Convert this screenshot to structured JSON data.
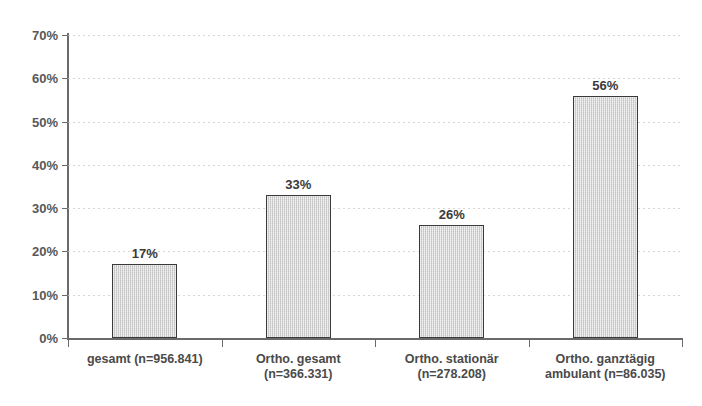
{
  "chart_data": {
    "type": "bar",
    "title": "",
    "xlabel": "",
    "ylabel": "",
    "ylim": [
      0,
      70
    ],
    "grid": true,
    "legend": "none",
    "y_tick_labels": [
      "70%",
      "60%",
      "50%",
      "40%",
      "30%",
      "20%",
      "10%",
      "0%"
    ],
    "y_tick_values": [
      70,
      60,
      50,
      40,
      30,
      20,
      10,
      0
    ],
    "categories": [
      "gesamt (n=956.841)",
      "Ortho. gesamt (n=366.331)",
      "Ortho. stationär (n=278.208)",
      "Ortho. ganztägig ambulant (n=86.035)"
    ],
    "category_lines": [
      [
        "gesamt (n=956.841)"
      ],
      [
        "Ortho. gesamt",
        "(n=366.331)"
      ],
      [
        "Ortho. stationär",
        "(n=278.208)"
      ],
      [
        "Ortho. ganztägig",
        "ambulant (n=86.035)"
      ]
    ],
    "values": [
      17,
      33,
      26,
      56
    ],
    "value_labels": [
      "17%",
      "33%",
      "26%",
      "56%"
    ],
    "bar_color": "#d2d2d2",
    "bar_border_color": "#3a3a3a",
    "axis_color": "#6a6a6a",
    "grid_color": "#cfcfcf"
  },
  "figure": {
    "clipped_title": ""
  }
}
